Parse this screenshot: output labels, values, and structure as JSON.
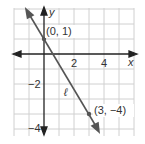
{
  "graph": {
    "x_axis_label": "x",
    "y_axis_label": "y",
    "x_ticks": [
      {
        "value": 2,
        "label": "2"
      },
      {
        "value": 4,
        "label": "4"
      }
    ],
    "y_ticks": [
      {
        "value": -2,
        "label": "−2"
      },
      {
        "value": -4,
        "label": "−4"
      }
    ],
    "line_label": "ℓ",
    "points": [
      {
        "label": "(0, 1)",
        "x": 0,
        "y": 1
      },
      {
        "label": "(3, −4)",
        "x": 3,
        "y": -4
      }
    ],
    "colors": {
      "grid": "#d0d0d0",
      "axis": "#222222",
      "line": "#555555"
    }
  }
}
